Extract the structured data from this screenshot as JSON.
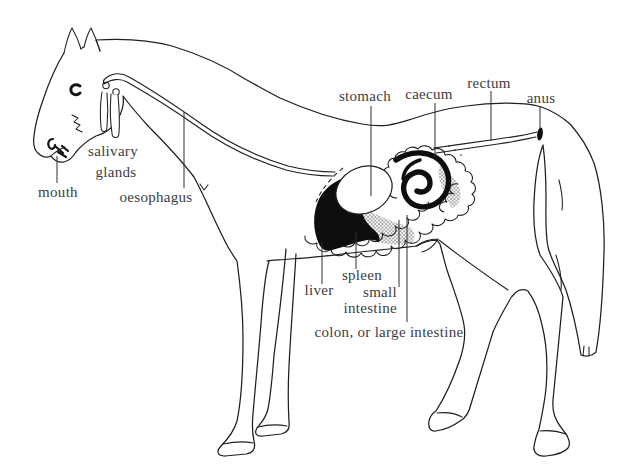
{
  "diagram": {
    "labels": {
      "mouth": "mouth",
      "salivary_glands": [
        "salivary",
        "glands"
      ],
      "oesophagus": "oesophagus",
      "stomach": "stomach",
      "caecum": "caecum",
      "rectum": "rectum",
      "anus": "anus",
      "liver": "liver",
      "spleen": "spleen",
      "small_intestine": [
        "small",
        "intestine"
      ],
      "colon": "colon, or large intestine"
    },
    "colors": {
      "background": "#ffffff",
      "line": "#1f1f1f",
      "text": "#3d3d3d",
      "organ_fill": "#0e0e0e"
    }
  }
}
